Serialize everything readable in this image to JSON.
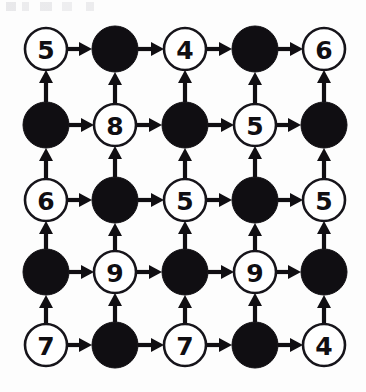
{
  "diagram": {
    "type": "directed-grid-graph",
    "rows": 5,
    "cols": 5,
    "colors": {
      "background": "#fdfdfd",
      "stroke": "#100e12",
      "open_node_fill": "#ffffff",
      "filled_node_fill": "#100e12",
      "label": "#100e12"
    },
    "geometry": {
      "col_centers": [
        46,
        115,
        185,
        255,
        324
      ],
      "row_centers": [
        49,
        125,
        200,
        272,
        345
      ],
      "open_radius": 21,
      "filled_radius": 23,
      "edge_width": 4.2,
      "arrow_len": 13,
      "arrow_halfwidth": 7
    },
    "edges": {
      "horizontal_direction": "right",
      "vertical_direction": "up"
    },
    "nodes": [
      [
        {
          "kind": "open",
          "label": "5"
        },
        {
          "kind": "filled",
          "label": ""
        },
        {
          "kind": "open",
          "label": "4"
        },
        {
          "kind": "filled",
          "label": ""
        },
        {
          "kind": "open",
          "label": "6"
        }
      ],
      [
        {
          "kind": "filled",
          "label": ""
        },
        {
          "kind": "open",
          "label": "8"
        },
        {
          "kind": "filled",
          "label": ""
        },
        {
          "kind": "open",
          "label": "5"
        },
        {
          "kind": "filled",
          "label": ""
        }
      ],
      [
        {
          "kind": "open",
          "label": "6"
        },
        {
          "kind": "filled",
          "label": ""
        },
        {
          "kind": "open",
          "label": "5"
        },
        {
          "kind": "filled",
          "label": ""
        },
        {
          "kind": "open",
          "label": "5"
        }
      ],
      [
        {
          "kind": "filled",
          "label": ""
        },
        {
          "kind": "open",
          "label": "9"
        },
        {
          "kind": "filled",
          "label": ""
        },
        {
          "kind": "open",
          "label": "9"
        },
        {
          "kind": "filled",
          "label": ""
        }
      ],
      [
        {
          "kind": "open",
          "label": "7"
        },
        {
          "kind": "filled",
          "label": ""
        },
        {
          "kind": "open",
          "label": "7"
        },
        {
          "kind": "filled",
          "label": ""
        },
        {
          "kind": "open",
          "label": "4"
        }
      ]
    ]
  }
}
